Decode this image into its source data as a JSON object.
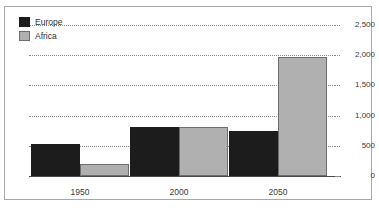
{
  "chart_data": {
    "type": "bar",
    "title": "",
    "subtitle": "",
    "xlabel": "",
    "ylabel": "",
    "categories": [
      "1950",
      "2000",
      "2050"
    ],
    "series": [
      {
        "name": "Europe",
        "color": "#1c1c1c",
        "values": [
          530,
          810,
          745
        ]
      },
      {
        "name": "Africa",
        "color": "#b0b0b0",
        "values": [
          205,
          810,
          1970
        ]
      }
    ],
    "ylim": [
      0,
      2500
    ],
    "ytick_values": [
      2500,
      2000,
      1500,
      1000,
      500,
      0
    ],
    "ytick_labels": [
      "2,500",
      "2,000",
      "1,500",
      "1,000",
      "500",
      "0"
    ],
    "yaxis_position": "right",
    "grid": true,
    "grid_style": "dotted",
    "legend": {
      "position": "top-left",
      "entries": [
        "Europe",
        "Africa"
      ]
    },
    "annotations": []
  },
  "legend": {
    "entries": [
      {
        "label": "Europe",
        "swatch": "legend-swatch-europe"
      },
      {
        "label": "Africa",
        "swatch": "legend-swatch-africa"
      }
    ]
  },
  "axes": {
    "y_labels": [
      "2,500",
      "2,000",
      "1,500",
      "1,000",
      "500",
      "0"
    ],
    "x_labels": [
      "1950",
      "2000",
      "2050"
    ]
  },
  "misc": {
    "top_sliver_text": ""
  }
}
